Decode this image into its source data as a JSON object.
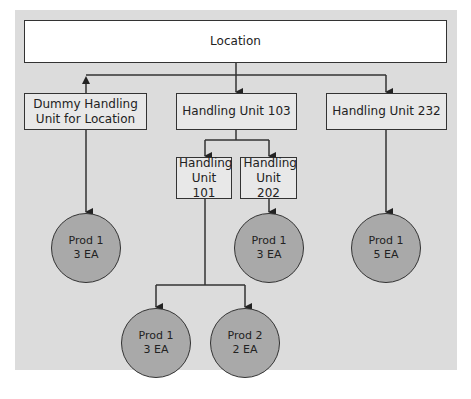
{
  "diagram": {
    "root": {
      "label": "Location"
    },
    "level1": [
      {
        "label": "Dummy Handling Unit for Location"
      },
      {
        "label": "Handling Unit 103"
      },
      {
        "label": "Handling Unit 232"
      }
    ],
    "level2": [
      {
        "label": "Handling Unit 101"
      },
      {
        "label": "Handling Unit 202"
      }
    ],
    "products": [
      {
        "name": "Prod 1",
        "qty": "3 EA",
        "parent": "Dummy Handling Unit for Location"
      },
      {
        "name": "Prod 1",
        "qty": "3 EA",
        "parent": "Handling Unit 202"
      },
      {
        "name": "Prod 1",
        "qty": "5 EA",
        "parent": "Handling Unit 232"
      },
      {
        "name": "Prod 1",
        "qty": "3 EA",
        "parent": "Handling Unit 101"
      },
      {
        "name": "Prod 2",
        "qty": "2 EA",
        "parent": "Handling Unit 101"
      }
    ],
    "colors": {
      "panel": "#dcdcdc",
      "box": "#e8e8e8",
      "root_box": "#ffffff",
      "circle": "#a9a9a9",
      "line": "#333333"
    }
  }
}
